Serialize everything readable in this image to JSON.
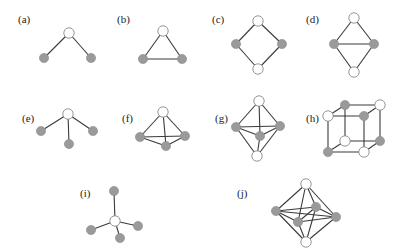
{
  "figure": {
    "colors": {
      "white_node": "#ffffff",
      "grey_node": "#9a9a9a",
      "edge": "#3a3a3a"
    },
    "panels": [
      {
        "id": "a",
        "label": "(a)",
        "label_pos": [
          18,
          23
        ],
        "nodes": [
          {
            "x": 69,
            "y": 33,
            "type": "white"
          },
          {
            "x": 44,
            "y": 58,
            "type": "grey"
          },
          {
            "x": 91,
            "y": 58,
            "type": "grey"
          }
        ],
        "edges": [
          [
            0,
            1
          ],
          [
            0,
            2
          ]
        ]
      },
      {
        "id": "b",
        "label": "(b)",
        "label_pos": [
          117,
          23
        ],
        "nodes": [
          {
            "x": 163,
            "y": 31,
            "type": "white"
          },
          {
            "x": 143,
            "y": 59,
            "type": "grey"
          },
          {
            "x": 182,
            "y": 59,
            "type": "grey"
          }
        ],
        "edges": [
          [
            0,
            1
          ],
          [
            0,
            2
          ],
          [
            1,
            2
          ]
        ]
      },
      {
        "id": "c",
        "label": "(c)",
        "label_pos": [
          212,
          23
        ],
        "nodes": [
          {
            "x": 258,
            "y": 21,
            "type": "white"
          },
          {
            "x": 236,
            "y": 44,
            "type": "grey"
          },
          {
            "x": 282,
            "y": 44,
            "type": "grey"
          },
          {
            "x": 258,
            "y": 69,
            "type": "white"
          }
        ],
        "edges": [
          [
            0,
            1
          ],
          [
            0,
            2
          ],
          [
            1,
            3
          ],
          [
            2,
            3
          ]
        ]
      },
      {
        "id": "d",
        "label": "(d)",
        "label_pos": [
          306,
          23
        ],
        "nodes": [
          {
            "x": 354,
            "y": 18,
            "type": "white"
          },
          {
            "x": 334,
            "y": 44,
            "type": "grey"
          },
          {
            "x": 374,
            "y": 44,
            "type": "grey"
          },
          {
            "x": 354,
            "y": 72,
            "type": "white"
          }
        ],
        "edges": [
          [
            0,
            1
          ],
          [
            0,
            2
          ],
          [
            1,
            2
          ],
          [
            1,
            3
          ],
          [
            2,
            3
          ]
        ]
      },
      {
        "id": "e",
        "label": "(e)",
        "label_pos": [
          22,
          122
        ],
        "nodes": [
          {
            "x": 68,
            "y": 114,
            "type": "white"
          },
          {
            "x": 41,
            "y": 131,
            "type": "grey"
          },
          {
            "x": 69,
            "y": 144,
            "type": "grey"
          },
          {
            "x": 93,
            "y": 131,
            "type": "grey"
          }
        ],
        "edges": [
          [
            0,
            1
          ],
          [
            0,
            2
          ],
          [
            0,
            3
          ]
        ]
      },
      {
        "id": "f",
        "label": "(f)",
        "label_pos": [
          122,
          122
        ],
        "nodes": [
          {
            "x": 163,
            "y": 112,
            "type": "white"
          },
          {
            "x": 140,
            "y": 137,
            "type": "grey"
          },
          {
            "x": 166,
            "y": 146,
            "type": "grey"
          },
          {
            "x": 185,
            "y": 136,
            "type": "grey"
          }
        ],
        "edges": [
          [
            0,
            1
          ],
          [
            0,
            2
          ],
          [
            0,
            3
          ],
          [
            1,
            2
          ],
          [
            2,
            3
          ],
          [
            1,
            3
          ]
        ]
      },
      {
        "id": "g",
        "label": "(g)",
        "label_pos": [
          215,
          122
        ],
        "nodes": [
          {
            "x": 259,
            "y": 101,
            "type": "white"
          },
          {
            "x": 236,
            "y": 127,
            "type": "grey"
          },
          {
            "x": 280,
            "y": 126,
            "type": "grey"
          },
          {
            "x": 260,
            "y": 136,
            "type": "grey"
          },
          {
            "x": 257,
            "y": 156,
            "type": "white"
          }
        ],
        "edges": [
          [
            0,
            1
          ],
          [
            0,
            2
          ],
          [
            0,
            3
          ],
          [
            1,
            2
          ],
          [
            1,
            3
          ],
          [
            2,
            3
          ],
          [
            4,
            1
          ],
          [
            4,
            2
          ],
          [
            4,
            3
          ]
        ]
      },
      {
        "id": "h",
        "label": "(h)",
        "label_pos": [
          306,
          122
        ],
        "nodes": [
          {
            "x": 345,
            "y": 105,
            "type": "grey"
          },
          {
            "x": 380,
            "y": 105,
            "type": "white"
          },
          {
            "x": 328,
            "y": 116,
            "type": "white"
          },
          {
            "x": 364,
            "y": 116,
            "type": "grey"
          },
          {
            "x": 345,
            "y": 141,
            "type": "white"
          },
          {
            "x": 380,
            "y": 141,
            "type": "grey"
          },
          {
            "x": 328,
            "y": 152,
            "type": "grey"
          },
          {
            "x": 364,
            "y": 152,
            "type": "white"
          }
        ],
        "edges": [
          [
            0,
            1
          ],
          [
            2,
            3
          ],
          [
            0,
            2
          ],
          [
            1,
            3
          ],
          [
            4,
            5
          ],
          [
            6,
            7
          ],
          [
            4,
            6
          ],
          [
            5,
            7
          ],
          [
            0,
            4
          ],
          [
            1,
            5
          ],
          [
            2,
            6
          ],
          [
            3,
            7
          ]
        ]
      },
      {
        "id": "i",
        "label": "(i)",
        "label_pos": [
          80,
          197
        ],
        "nodes": [
          {
            "x": 115,
            "y": 221,
            "type": "white"
          },
          {
            "x": 114,
            "y": 191,
            "type": "grey"
          },
          {
            "x": 91,
            "y": 230,
            "type": "grey"
          },
          {
            "x": 120,
            "y": 238,
            "type": "grey"
          },
          {
            "x": 138,
            "y": 226,
            "type": "grey"
          }
        ],
        "edges": [
          [
            0,
            1
          ],
          [
            0,
            2
          ],
          [
            0,
            3
          ],
          [
            0,
            4
          ]
        ]
      },
      {
        "id": "j",
        "label": "(j)",
        "label_pos": [
          237,
          197
        ],
        "nodes": [
          {
            "x": 306,
            "y": 184,
            "type": "white"
          },
          {
            "x": 276,
            "y": 211,
            "type": "grey"
          },
          {
            "x": 316,
            "y": 207,
            "type": "grey"
          },
          {
            "x": 298,
            "y": 222,
            "type": "grey"
          },
          {
            "x": 336,
            "y": 217,
            "type": "grey"
          },
          {
            "x": 306,
            "y": 242,
            "type": "white"
          }
        ],
        "edges": [
          [
            0,
            1
          ],
          [
            0,
            2
          ],
          [
            0,
            3
          ],
          [
            0,
            4
          ],
          [
            1,
            2
          ],
          [
            1,
            3
          ],
          [
            2,
            4
          ],
          [
            3,
            4
          ],
          [
            1,
            4
          ],
          [
            2,
            3
          ],
          [
            5,
            1
          ],
          [
            5,
            2
          ],
          [
            5,
            3
          ],
          [
            5,
            4
          ]
        ]
      }
    ]
  }
}
